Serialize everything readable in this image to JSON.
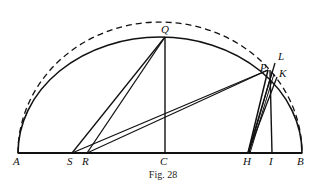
{
  "figure": {
    "caption": "Fig. 28",
    "colors": {
      "ink": "#111111",
      "background": "#ffffff"
    },
    "baseline": {
      "from": "A",
      "to": "B",
      "y": 153
    },
    "points": [
      {
        "id": "A",
        "label": "A",
        "x": 18,
        "y": 153,
        "label_x": 13,
        "label_y": 156
      },
      {
        "id": "S",
        "label": "S",
        "x": 72,
        "y": 153,
        "label_x": 67,
        "label_y": 156
      },
      {
        "id": "R",
        "label": "R",
        "x": 87,
        "y": 153,
        "label_x": 82,
        "label_y": 156
      },
      {
        "id": "C",
        "label": "C",
        "x": 165,
        "y": 153,
        "label_x": 160,
        "label_y": 156
      },
      {
        "id": "H",
        "label": "H",
        "x": 248,
        "y": 153,
        "label_x": 243,
        "label_y": 156
      },
      {
        "id": "I",
        "label": "I",
        "x": 272,
        "y": 153,
        "label_x": 269,
        "label_y": 156
      },
      {
        "id": "B",
        "label": "B",
        "x": 302,
        "y": 153,
        "label_x": 297,
        "label_y": 156
      },
      {
        "id": "Q",
        "label": "Q",
        "x": 165,
        "y": 37,
        "label_x": 161,
        "label_y": 24
      },
      {
        "id": "P",
        "label": "P",
        "x": 268,
        "y": 70,
        "label_x": 261,
        "label_y": 63
      },
      {
        "id": "L",
        "label": "L",
        "x": 276,
        "y": 62,
        "label_x": 279,
        "label_y": 52
      },
      {
        "id": "K",
        "label": "K",
        "x": 278,
        "y": 76,
        "label_x": 279,
        "label_y": 69
      }
    ],
    "arcs": [
      {
        "name": "dashed-semicircle",
        "style": "dashed",
        "center_x": 160,
        "center_y": 153,
        "radius_x": 142,
        "radius_y": 131
      },
      {
        "name": "solid-ellipse-arc",
        "style": "solid",
        "center_x": 160,
        "center_y": 153,
        "radius_x": 142,
        "radius_y": 116
      }
    ],
    "segments": [
      {
        "name": "baseline-AB",
        "from": "A",
        "to": "B"
      },
      {
        "name": "segment-CQ",
        "from": "C",
        "to": "Q"
      },
      {
        "name": "segment-SQ",
        "from": "S",
        "to": "Q"
      },
      {
        "name": "segment-RQ",
        "from": "R",
        "to": "Q"
      },
      {
        "name": "segment-SP",
        "from": "S",
        "to": "P"
      },
      {
        "name": "segment-RP",
        "from": "R",
        "to": "P"
      },
      {
        "name": "segment-IP",
        "from": "I",
        "to": "P"
      },
      {
        "name": "segment-HP",
        "from": "H",
        "to": "P"
      },
      {
        "name": "segment-HL",
        "from": "H",
        "to": "L"
      },
      {
        "name": "segment-HK",
        "from": "H",
        "to": "K"
      }
    ]
  }
}
